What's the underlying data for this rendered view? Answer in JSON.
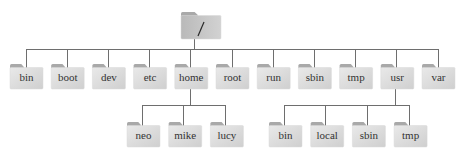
{
  "diagram": {
    "type": "directory-tree",
    "root": {
      "label": "/",
      "icon": "folder-icon",
      "children": [
        {
          "label": "bin",
          "icon": "folder-icon"
        },
        {
          "label": "boot",
          "icon": "folder-icon"
        },
        {
          "label": "dev",
          "icon": "folder-icon"
        },
        {
          "label": "etc",
          "icon": "folder-icon"
        },
        {
          "label": "home",
          "icon": "folder-icon",
          "children": [
            {
              "label": "neo",
              "icon": "folder-icon"
            },
            {
              "label": "mike",
              "icon": "folder-icon"
            },
            {
              "label": "lucy",
              "icon": "folder-icon"
            }
          ]
        },
        {
          "label": "root",
          "icon": "folder-icon"
        },
        {
          "label": "run",
          "icon": "folder-icon"
        },
        {
          "label": "sbin",
          "icon": "folder-icon"
        },
        {
          "label": "tmp",
          "icon": "folder-icon"
        },
        {
          "label": "usr",
          "icon": "folder-icon",
          "children": [
            {
              "label": "bin",
              "icon": "folder-icon"
            },
            {
              "label": "local",
              "icon": "folder-icon"
            },
            {
              "label": "sbin",
              "icon": "folder-icon"
            },
            {
              "label": "tmp",
              "icon": "folder-icon"
            }
          ]
        },
        {
          "label": "var",
          "icon": "folder-icon"
        }
      ]
    },
    "colors": {
      "folder_light": "#e6e6e6",
      "folder_dark": "#c4c4c4",
      "folder_tab": "#a9a9a9",
      "edge": "#6e6e6e",
      "text": "#333333"
    }
  }
}
